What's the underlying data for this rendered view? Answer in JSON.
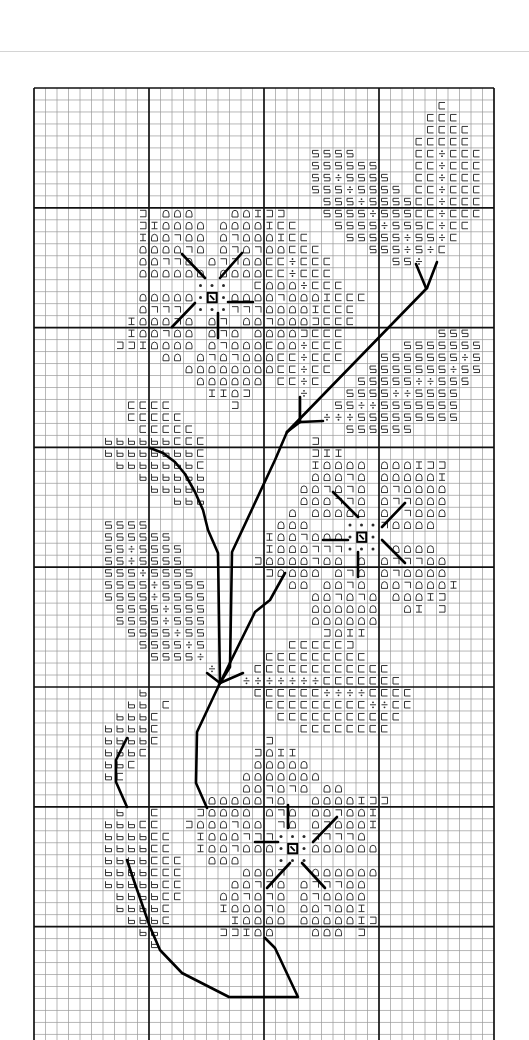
{
  "page": {
    "width": 529,
    "height": 1040
  },
  "colors": {
    "background": "#ffffff",
    "grid_thin": "#9a9a9a",
    "grid_bold": "#111111",
    "symbol": "#2b2b2b",
    "backstitch": "#000000",
    "page_rule": "#d4d4d4"
  },
  "grid": {
    "origin_x": 34,
    "origin_y": 88,
    "cell_w": 11.5,
    "cell_h": 11.98,
    "columns": 40,
    "rows": 80,
    "bold_every": 10,
    "bottom_limit": 1040
  },
  "legend": {
    "C": {
      "name": "open-square-left",
      "glyph": "⊏"
    },
    "J": {
      "name": "open-square-right",
      "glyph": "⊐"
    },
    "S": {
      "name": "squared-s",
      "glyph": "5"
    },
    "D": {
      "name": "divide",
      "glyph": "÷"
    },
    "A": {
      "name": "bell-arch",
      "glyph": "⌂"
    },
    "7": {
      "name": "corner-bracket",
      "glyph": "¬"
    },
    "I": {
      "name": "i-beam",
      "glyph": "I"
    },
    "b": {
      "name": "small-b",
      "glyph": "b"
    },
    ".": {
      "name": "french-knot-dot",
      "glyph": "•"
    },
    "X": {
      "name": "center-box",
      "glyph": "⊠"
    }
  },
  "cells": [
    [
      1,
      35,
      "C"
    ],
    [
      2,
      34,
      "CCC"
    ],
    [
      3,
      34,
      "CCCC"
    ],
    [
      4,
      33,
      "CCCCC"
    ],
    [
      5,
      24,
      "SSSS"
    ],
    [
      5,
      33,
      "CCDCCC"
    ],
    [
      6,
      24,
      "SSSSSS"
    ],
    [
      6,
      33,
      "CCDCCC"
    ],
    [
      7,
      24,
      "SSDSSSS"
    ],
    [
      7,
      33,
      "CCDCCC"
    ],
    [
      8,
      24,
      "SSSDSSSS"
    ],
    [
      8,
      33,
      "CCDCCC"
    ],
    [
      9,
      25,
      "SSSDSSSS"
    ],
    [
      9,
      33,
      "CCDCCC"
    ],
    [
      10,
      9,
      "J"
    ],
    [
      10,
      11,
      "AAA"
    ],
    [
      10,
      17,
      "AAIJJ"
    ],
    [
      10,
      25,
      "SSSSDSSS"
    ],
    [
      10,
      33,
      "CCDCCC"
    ],
    [
      11,
      9,
      "JIAAAA"
    ],
    [
      11,
      16,
      "AAAAICC"
    ],
    [
      11,
      26,
      "SSSSDSSSCDCC"
    ],
    [
      12,
      9,
      "IAA7AA"
    ],
    [
      12,
      16,
      "A7AAAICC"
    ],
    [
      12,
      27,
      "SSSSSDSSDC"
    ],
    [
      13,
      9,
      "AAAA7A"
    ],
    [
      13,
      16,
      "A7A7AACCC"
    ],
    [
      13,
      29,
      "SSSDSDC"
    ],
    [
      14,
      9,
      "AA77A"
    ],
    [
      14,
      15,
      "A77AACCDCCC"
    ],
    [
      14,
      31,
      "SSD"
    ],
    [
      15,
      9,
      "AAAAAA"
    ],
    [
      15,
      16,
      "AAAACCDCCC"
    ],
    [
      16,
      14,
      "..."
    ],
    [
      16,
      19,
      "CAAADCCC"
    ],
    [
      17,
      9,
      "AAAAA"
    ],
    [
      17,
      14,
      ".X."
    ],
    [
      17,
      17,
      "AAAA7AAAICCC"
    ],
    [
      18,
      9,
      "A777"
    ],
    [
      18,
      14,
      "..."
    ],
    [
      18,
      17,
      "777AAAAICCC"
    ],
    [
      19,
      8,
      "IAAA7A"
    ],
    [
      19,
      15,
      "A7"
    ],
    [
      19,
      18,
      "AA7AAAJCCC"
    ],
    [
      20,
      8,
      "IAA7AA"
    ],
    [
      20,
      15,
      "A7A"
    ],
    [
      20,
      19,
      "AAAAJCCC"
    ],
    [
      20,
      35,
      "SSS"
    ],
    [
      21,
      7,
      "JJIAAAA"
    ],
    [
      21,
      15,
      "A7AAAC"
    ],
    [
      21,
      21,
      "AADCCC"
    ],
    [
      21,
      32,
      "SSSSSSS"
    ],
    [
      22,
      11,
      "AA"
    ],
    [
      22,
      14,
      "A7A7AAA"
    ],
    [
      22,
      21,
      "CCDCCC"
    ],
    [
      22,
      30,
      "SSSSSSSDS"
    ],
    [
      23,
      13,
      "AAAAAAAA"
    ],
    [
      23,
      21,
      "CCDCC"
    ],
    [
      23,
      29,
      "SSSSSSSDSS"
    ],
    [
      24,
      14,
      "AAAAAA"
    ],
    [
      24,
      21,
      "CCDC"
    ],
    [
      24,
      28,
      "SSSSSDDSSS"
    ],
    [
      25,
      15,
      "IIAJ"
    ],
    [
      25,
      23,
      "D"
    ],
    [
      25,
      27,
      "SSSSDDSSSS"
    ],
    [
      26,
      8,
      "CCCC"
    ],
    [
      26,
      17,
      "J"
    ],
    [
      26,
      26,
      "SSDDSSSSSSS"
    ],
    [
      27,
      8,
      "CCCCC"
    ],
    [
      27,
      25,
      "DDDSSSSSSSSS"
    ],
    [
      28,
      9,
      "CCCCC"
    ],
    [
      28,
      27,
      "SSSSSS"
    ],
    [
      29,
      6,
      "bbbbbbCCC"
    ],
    [
      29,
      24,
      "J"
    ],
    [
      30,
      6,
      "bbbbbbbbC"
    ],
    [
      30,
      24,
      "JII"
    ],
    [
      31,
      7,
      "bbbbbbbC"
    ],
    [
      31,
      24,
      "IAAAA"
    ],
    [
      31,
      30,
      "AAAIJJ"
    ],
    [
      32,
      9,
      "bbbbbb"
    ],
    [
      32,
      24,
      "AAA7A"
    ],
    [
      32,
      30,
      "AAAAAI"
    ],
    [
      33,
      10,
      "bbbbb"
    ],
    [
      33,
      23,
      "AA7A7A"
    ],
    [
      33,
      30,
      "A7AAAA"
    ],
    [
      34,
      12,
      "bbb"
    ],
    [
      34,
      23,
      "AAA77A"
    ],
    [
      34,
      30,
      "A77AAA"
    ],
    [
      35,
      22,
      "A"
    ],
    [
      35,
      24,
      "AAAA"
    ],
    [
      35,
      28,
      "A"
    ],
    [
      35,
      30,
      "A 7AAA"
    ],
    [
      36,
      6,
      "SSSS"
    ],
    [
      36,
      21,
      "AAA"
    ],
    [
      36,
      27,
      "..."
    ],
    [
      36,
      30,
      "7AAAA"
    ],
    [
      37,
      6,
      "SSSSSS"
    ],
    [
      37,
      20,
      "IAA7AAA"
    ],
    [
      37,
      27,
      ".X."
    ],
    [
      38,
      6,
      "SSDSSSS"
    ],
    [
      38,
      20,
      "IAAA777"
    ],
    [
      38,
      27,
      "..."
    ],
    [
      38,
      31,
      "AAAA"
    ],
    [
      39,
      6,
      "SSDSSSS"
    ],
    [
      39,
      19,
      "JAAAA7AA"
    ],
    [
      39,
      28,
      "A"
    ],
    [
      39,
      30,
      "A777AA"
    ],
    [
      40,
      6,
      "SSSDSSSS"
    ],
    [
      40,
      20,
      "JAAAA"
    ],
    [
      40,
      26,
      "A7A"
    ],
    [
      40,
      30,
      "A7AAAA"
    ],
    [
      41,
      6,
      "SSSSDSSSS"
    ],
    [
      41,
      22,
      "AA"
    ],
    [
      41,
      25,
      "AA7A"
    ],
    [
      41,
      30,
      "AA7AAAI"
    ],
    [
      42,
      6,
      "SSSSDSSSS"
    ],
    [
      42,
      24,
      "AA7A7A"
    ],
    [
      42,
      31,
      "AAAIJ"
    ],
    [
      43,
      7,
      "SSSSDSSS"
    ],
    [
      43,
      24,
      "AAAAAA"
    ],
    [
      43,
      32,
      "AI J"
    ],
    [
      44,
      7,
      "SSSSDSSS"
    ],
    [
      44,
      24,
      "AAAAAA"
    ],
    [
      45,
      8,
      "SSSSDSS"
    ],
    [
      45,
      25,
      "JAII"
    ],
    [
      46,
      9,
      "SSSSDS"
    ],
    [
      46,
      22,
      "CCCCCJ"
    ],
    [
      47,
      10,
      "SSSSD"
    ],
    [
      47,
      20,
      "CCCCCCCCC"
    ],
    [
      48,
      15,
      "D"
    ],
    [
      48,
      19,
      "CCCCCCCCCCCC"
    ],
    [
      49,
      18,
      "DDDDDDDCCCCCCC"
    ],
    [
      50,
      9,
      "b"
    ],
    [
      50,
      19,
      "CCCCCCDDDDCCCC"
    ],
    [
      51,
      8,
      "bb"
    ],
    [
      51,
      11,
      "C"
    ],
    [
      51,
      20,
      "CCCCCCCCCDDCC"
    ],
    [
      52,
      7,
      "bbbC"
    ],
    [
      52,
      21,
      "CCCCCCCCCCC"
    ],
    [
      53,
      6,
      "bbbbC"
    ],
    [
      53,
      23,
      "CCCCCCCC"
    ],
    [
      54,
      6,
      "bbbbC"
    ],
    [
      54,
      20,
      "J"
    ],
    [
      55,
      6,
      "bbbC"
    ],
    [
      55,
      19,
      "JAII"
    ],
    [
      56,
      6,
      "bbC"
    ],
    [
      56,
      19,
      "AAAAA"
    ],
    [
      57,
      6,
      "bC"
    ],
    [
      57,
      18,
      "AAAAAAA"
    ],
    [
      58,
      18,
      "AA7A7A"
    ],
    [
      58,
      25,
      "AA"
    ],
    [
      59,
      15,
      "AAA"
    ],
    [
      59,
      18,
      "AA7A"
    ],
    [
      59,
      24,
      "AAAAIJJ"
    ],
    [
      60,
      7,
      "b"
    ],
    [
      60,
      10,
      "C"
    ],
    [
      60,
      14,
      "JAAAA"
    ],
    [
      60,
      20,
      "A7A"
    ],
    [
      60,
      24,
      "AA7AAI"
    ],
    [
      61,
      6,
      "bbbCC"
    ],
    [
      61,
      13,
      "JAAA7AA"
    ],
    [
      61,
      21,
      "7A"
    ],
    [
      61,
      24,
      "A7AAAI"
    ],
    [
      62,
      6,
      "bbbbCC"
    ],
    [
      62,
      14,
      "IAAA777"
    ],
    [
      62,
      21,
      "..."
    ],
    [
      62,
      24,
      "7777A"
    ],
    [
      63,
      6,
      "bbbbCC"
    ],
    [
      63,
      14,
      "IAA7AAA"
    ],
    [
      63,
      21,
      ".X."
    ],
    [
      63,
      24,
      "AAAAAA"
    ],
    [
      64,
      6,
      "bbbbCCC"
    ],
    [
      64,
      15,
      "AAA"
    ],
    [
      64,
      21,
      "..."
    ],
    [
      65,
      6,
      "bbbbCCC"
    ],
    [
      65,
      18,
      "AAA7"
    ],
    [
      65,
      24,
      "AAAAAA"
    ],
    [
      66,
      6,
      "bbbbbCC"
    ],
    [
      66,
      17,
      "AA77A"
    ],
    [
      66,
      23,
      "A777AA"
    ],
    [
      67,
      7,
      "bbbbCC"
    ],
    [
      67,
      16,
      "AA7A7A"
    ],
    [
      67,
      23,
      "A7AAAA"
    ],
    [
      68,
      7,
      "bbbbC"
    ],
    [
      68,
      16,
      "IAAA7A"
    ],
    [
      68,
      23,
      "AA7AAI"
    ],
    [
      69,
      8,
      "bbbC"
    ],
    [
      69,
      17,
      "IAAAA"
    ],
    [
      69,
      23,
      "AAAAAIJ"
    ],
    [
      70,
      9,
      "bb"
    ],
    [
      70,
      16,
      "JJIAA"
    ],
    [
      70,
      24,
      "AAA"
    ],
    [
      70,
      28,
      "J"
    ],
    [
      71,
      10,
      "b"
    ]
  ],
  "backstitch": [
    {
      "name": "upper-twig-left",
      "points": [
        [
          416,
          264
        ],
        [
          426,
          288
        ]
      ]
    },
    {
      "name": "upper-twig-right",
      "points": [
        [
          437,
          262
        ],
        [
          427,
          288
        ]
      ]
    },
    {
      "name": "main-branch-diagonal",
      "points": [
        [
          427,
          288
        ],
        [
          287,
          432
        ]
      ]
    },
    {
      "name": "spur-vertical",
      "points": [
        [
          300,
          397
        ],
        [
          300,
          422
        ]
      ]
    },
    {
      "name": "spur-horizontal",
      "points": [
        [
          300,
          422
        ],
        [
          323,
          421
        ]
      ]
    },
    {
      "name": "spur-join",
      "points": [
        [
          300,
          422
        ],
        [
          287,
          432
        ]
      ]
    },
    {
      "name": "stem-right",
      "points": [
        [
          287,
          432
        ],
        [
          275,
          460
        ],
        [
          232,
          552
        ],
        [
          230,
          667
        ],
        [
          220,
          683
        ]
      ]
    },
    {
      "name": "stem-left-curve",
      "points": [
        [
          150,
          448
        ],
        [
          163,
          453
        ],
        [
          175,
          462
        ],
        [
          185,
          474
        ],
        [
          195,
          492
        ],
        [
          203,
          510
        ],
        [
          208,
          530
        ],
        [
          218,
          553
        ],
        [
          220,
          683
        ]
      ]
    },
    {
      "name": "side-branch",
      "points": [
        [
          285,
          573
        ],
        [
          270,
          600
        ],
        [
          255,
          612
        ],
        [
          220,
          683
        ]
      ]
    },
    {
      "name": "node-spur-left",
      "points": [
        [
          207,
          673
        ],
        [
          220,
          683
        ]
      ]
    },
    {
      "name": "node-spur-right",
      "points": [
        [
          243,
          673
        ],
        [
          220,
          683
        ]
      ]
    },
    {
      "name": "lower-stem",
      "points": [
        [
          220,
          683
        ],
        [
          197,
          732
        ],
        [
          196,
          783
        ],
        [
          207,
          808
        ]
      ]
    },
    {
      "name": "left-leaf-stem",
      "points": [
        [
          127,
          738
        ],
        [
          116,
          760
        ],
        [
          116,
          782
        ],
        [
          127,
          807
        ]
      ]
    },
    {
      "name": "bottom-loop",
      "points": [
        [
          127,
          860
        ],
        [
          133,
          878
        ],
        [
          150,
          927
        ],
        [
          160,
          950
        ],
        [
          182,
          973
        ],
        [
          229,
          997
        ],
        [
          298,
          997
        ],
        [
          275,
          948
        ],
        [
          265,
          938
        ]
      ]
    },
    {
      "name": "top-flower-nw",
      "points": [
        [
          182,
          254
        ],
        [
          205,
          278
        ]
      ]
    },
    {
      "name": "top-flower-ne",
      "points": [
        [
          242,
          253
        ],
        [
          220,
          278
        ]
      ]
    },
    {
      "name": "top-flower-sw",
      "points": [
        [
          172,
          327
        ],
        [
          195,
          303
        ]
      ]
    },
    {
      "name": "top-flower-underline",
      "points": [
        [
          228,
          302
        ],
        [
          253,
          302
        ]
      ]
    },
    {
      "name": "top-flower-vertical",
      "points": [
        [
          218,
          313
        ],
        [
          218,
          338
        ]
      ]
    },
    {
      "name": "middle-flower-nw",
      "points": [
        [
          333,
          492
        ],
        [
          358,
          517
        ]
      ]
    },
    {
      "name": "middle-flower-ne",
      "points": [
        [
          405,
          503
        ],
        [
          382,
          527
        ]
      ]
    },
    {
      "name": "middle-flower-se",
      "points": [
        [
          382,
          540
        ],
        [
          405,
          563
        ]
      ]
    },
    {
      "name": "middle-flower-horizontal",
      "points": [
        [
          323,
          540
        ],
        [
          348,
          540
        ]
      ]
    },
    {
      "name": "middle-flower-vertical",
      "points": [
        [
          358,
          552
        ],
        [
          358,
          577
        ]
      ]
    },
    {
      "name": "bottom-flower-horizontal",
      "points": [
        [
          255,
          842
        ],
        [
          278,
          842
        ]
      ]
    },
    {
      "name": "bottom-flower-vertical",
      "points": [
        [
          288,
          805
        ],
        [
          288,
          828
        ]
      ]
    },
    {
      "name": "bottom-flower-ne",
      "points": [
        [
          337,
          817
        ],
        [
          313,
          842
        ]
      ]
    },
    {
      "name": "bottom-flower-sw",
      "points": [
        [
          290,
          863
        ],
        [
          267,
          888
        ]
      ]
    },
    {
      "name": "bottom-flower-se",
      "points": [
        [
          302,
          863
        ],
        [
          325,
          888
        ]
      ]
    }
  ]
}
